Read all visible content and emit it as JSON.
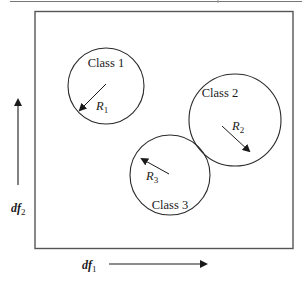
{
  "diagram": {
    "type": "class-regions-in-discriminant-space",
    "classes": [
      {
        "label": "Class 1",
        "radius_label": "R",
        "radius_sub": "1"
      },
      {
        "label": "Class 2",
        "radius_label": "R",
        "radius_sub": "2"
      },
      {
        "label": "Class 3",
        "radius_label": "R",
        "radius_sub": "3"
      }
    ],
    "axes": {
      "x": {
        "label": "df",
        "sub": "1"
      },
      "y": {
        "label": "df",
        "sub": "2"
      }
    },
    "colors": {
      "stroke": "#2a2a2a",
      "frame": "#555555",
      "background": "#ffffff"
    }
  }
}
